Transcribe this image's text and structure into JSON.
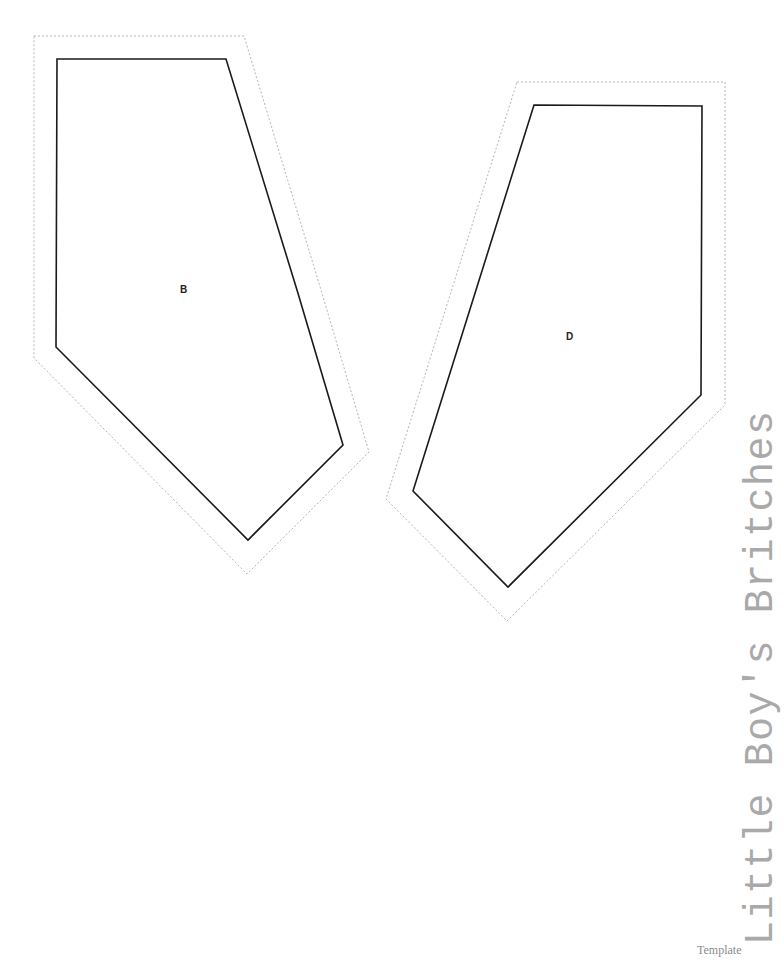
{
  "document": {
    "title": "Little Boy's Britches",
    "footer": "Template"
  },
  "pieces": [
    {
      "label": "B",
      "cut_line": "57,59 226,59 297,290 343,445 248,540 56,347",
      "seam_allowance_line": "34,36 244,36 321,290 369,452 247,574 34,358",
      "label_pos": [
        180,
        284
      ]
    },
    {
      "label": "D",
      "cut_line": "534,105 702,106 701,395 508,587 413,491",
      "seam_allowance_line": "517,82 725,82 725,405 507,621 386,499",
      "label_pos": [
        566,
        331
      ]
    }
  ],
  "colors": {
    "cut_line": "#1a1a1a",
    "seam_line": "#b5b5b5",
    "title": "#a9a9a9"
  }
}
